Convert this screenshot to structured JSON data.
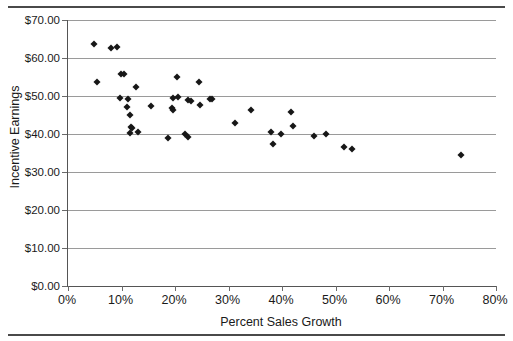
{
  "chart_data": {
    "type": "scatter",
    "title": "",
    "xlabel": "Percent Sales Growth",
    "ylabel": "Incentive Earnings",
    "xlim": [
      0,
      80
    ],
    "ylim": [
      0,
      70
    ],
    "grid": "horizontal",
    "legend": "none",
    "x_tick_labels": [
      "0%",
      "10%",
      "20%",
      "30%",
      "40%",
      "50%",
      "60%",
      "70%",
      "80%"
    ],
    "x_tick_values": [
      0,
      10,
      20,
      30,
      40,
      50,
      60,
      70,
      80
    ],
    "y_tick_labels": [
      "$0.00",
      "$10.00",
      "$20.00",
      "$30.00",
      "$40.00",
      "$50.00",
      "$60.00",
      "$70.00"
    ],
    "y_tick_values": [
      0,
      10,
      20,
      30,
      40,
      50,
      60,
      70
    ],
    "marker": "diamond",
    "marker_color": "#171717",
    "points": [
      {
        "x": 4.9,
        "y": 63.8
      },
      {
        "x": 5.4,
        "y": 53.7
      },
      {
        "x": 8.0,
        "y": 62.6
      },
      {
        "x": 9.2,
        "y": 62.8
      },
      {
        "x": 9.9,
        "y": 55.7
      },
      {
        "x": 10.5,
        "y": 55.7
      },
      {
        "x": 9.8,
        "y": 49.6
      },
      {
        "x": 11.2,
        "y": 49.1
      },
      {
        "x": 11.0,
        "y": 47.0
      },
      {
        "x": 11.6,
        "y": 45.0
      },
      {
        "x": 11.8,
        "y": 41.8
      },
      {
        "x": 12.0,
        "y": 41.5
      },
      {
        "x": 11.6,
        "y": 40.2
      },
      {
        "x": 13.0,
        "y": 40.4
      },
      {
        "x": 12.8,
        "y": 52.4
      },
      {
        "x": 15.5,
        "y": 47.3
      },
      {
        "x": 18.6,
        "y": 38.9
      },
      {
        "x": 19.6,
        "y": 49.4
      },
      {
        "x": 19.5,
        "y": 46.8
      },
      {
        "x": 19.7,
        "y": 46.3
      },
      {
        "x": 20.4,
        "y": 55.1
      },
      {
        "x": 20.6,
        "y": 49.8
      },
      {
        "x": 21.8,
        "y": 40.1
      },
      {
        "x": 22.4,
        "y": 39.2
      },
      {
        "x": 22.5,
        "y": 49.0
      },
      {
        "x": 23.0,
        "y": 48.6
      },
      {
        "x": 24.4,
        "y": 53.6
      },
      {
        "x": 24.6,
        "y": 47.6
      },
      {
        "x": 26.6,
        "y": 49.3
      },
      {
        "x": 27.0,
        "y": 49.2
      },
      {
        "x": 31.2,
        "y": 42.9
      },
      {
        "x": 34.2,
        "y": 46.2
      },
      {
        "x": 37.9,
        "y": 40.5
      },
      {
        "x": 38.3,
        "y": 37.3
      },
      {
        "x": 39.8,
        "y": 39.9
      },
      {
        "x": 41.6,
        "y": 45.7
      },
      {
        "x": 42.1,
        "y": 42.1
      },
      {
        "x": 46.0,
        "y": 39.5
      },
      {
        "x": 48.3,
        "y": 40.0
      },
      {
        "x": 51.5,
        "y": 36.7
      },
      {
        "x": 53.0,
        "y": 36.1
      },
      {
        "x": 73.4,
        "y": 34.4
      }
    ]
  }
}
